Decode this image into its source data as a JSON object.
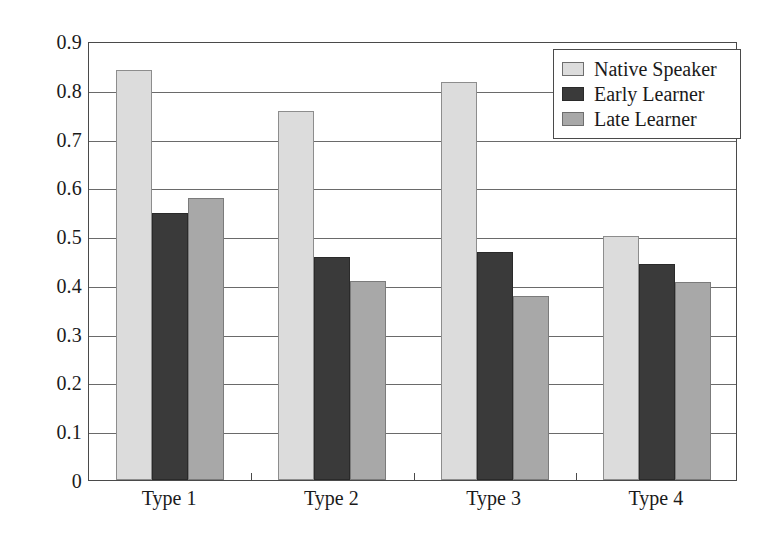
{
  "chart_data": {
    "type": "bar",
    "title": "",
    "subtitle": "",
    "xlabel": "",
    "ylabel": "",
    "categories": [
      "Type 1",
      "Type 2",
      "Type 3",
      "Type 4"
    ],
    "series": [
      {
        "name": "Native Speaker",
        "color": "#dcdcdc",
        "values": [
          0.84,
          0.757,
          0.817,
          0.5
        ]
      },
      {
        "name": "Early Learner",
        "color": "#3a3a3a",
        "values": [
          0.548,
          0.457,
          0.467,
          0.443
        ]
      },
      {
        "name": "Late Learner",
        "color": "#a8a8a8",
        "values": [
          0.578,
          0.408,
          0.378,
          0.405
        ]
      }
    ],
    "ylim": [
      0,
      0.9
    ],
    "ytick_labels": [
      "0",
      "0.1",
      "0.2",
      "0.3",
      "0.4",
      "0.5",
      "0.6",
      "0.7",
      "0.8",
      "0.9"
    ],
    "ytick_values": [
      0,
      0.1,
      0.2,
      0.3,
      0.4,
      0.5,
      0.6,
      0.7,
      0.8,
      0.9
    ],
    "grid": true,
    "grid_axis": "y",
    "legend_position": "top-right",
    "bar_layout": "grouped-adjacent",
    "frame": true
  },
  "legend": {
    "items": [
      {
        "label": "Native Speaker"
      },
      {
        "label": "Early Learner"
      },
      {
        "label": "Late Learner"
      }
    ]
  }
}
